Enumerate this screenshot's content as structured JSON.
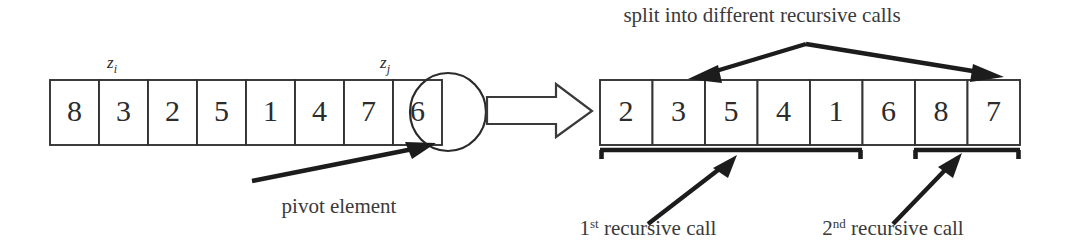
{
  "figure": {
    "title_caption": "split into different recursive calls",
    "left_array": {
      "name": "input-array",
      "values": [
        "8",
        "3",
        "2",
        "5",
        "1",
        "4",
        "7",
        "6"
      ],
      "index_labels": [
        {
          "label": "z",
          "subscript": "i",
          "cell_index": 1
        },
        {
          "label": "z",
          "subscript": "j",
          "cell_index": 6
        }
      ],
      "pivot_cell_index": 7,
      "pivot_value": "6",
      "pivot_caption": "pivot element"
    },
    "transform_arrow": {
      "name": "implies-arrow",
      "glyph": "double-right-arrow"
    },
    "right_array": {
      "name": "partitioned-array",
      "values": [
        "2",
        "3",
        "5",
        "4",
        "1",
        "6",
        "8",
        "7"
      ],
      "pivot_cell_index": 5,
      "groups": [
        {
          "name": "first-recursive-call",
          "caption": "recursive call",
          "ordinal_number": "1",
          "ordinal_suffix": "st",
          "start_cell": 0,
          "end_cell": 4
        },
        {
          "name": "second-recursive-call",
          "caption": "recursive call",
          "ordinal_number": "2",
          "ordinal_suffix": "nd",
          "start_cell": 6,
          "end_cell": 7
        }
      ]
    },
    "colors": {
      "ink": "#2b2b2b",
      "box_stroke": "#333333",
      "arrow_fill": "#1c1c1c",
      "background": "#ffffff"
    }
  }
}
